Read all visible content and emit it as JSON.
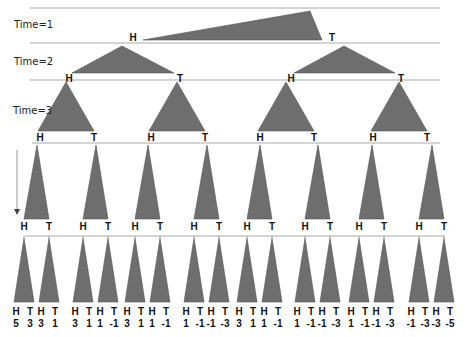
{
  "diagram": {
    "type": "binary coin-flip tree",
    "colors": {
      "triangle_fill": "#6e6e6e",
      "triangle_stroke": "#555555",
      "line": "#a9a9a9",
      "text": "#111111"
    },
    "time_labels": [
      "Time=1",
      "Time=2",
      "Time=3"
    ],
    "branch_labels": {
      "heads": "H",
      "tails": "T"
    },
    "levels": [
      {
        "level": 1,
        "nodes": 1
      },
      {
        "level": 2,
        "nodes": 2
      },
      {
        "level": 3,
        "nodes": 4
      },
      {
        "level": 4,
        "nodes": 8
      },
      {
        "level": 5,
        "nodes": 16
      }
    ],
    "leaf_values": [
      [
        "5",
        "3"
      ],
      [
        "3",
        "1"
      ],
      [
        "3",
        "1"
      ],
      [
        "1",
        "-1"
      ],
      [
        "3",
        "1"
      ],
      [
        "1",
        "-1"
      ],
      [
        "1",
        "-1"
      ],
      [
        "-1",
        "-3"
      ],
      [
        "3",
        "1"
      ],
      [
        "1",
        "-1"
      ],
      [
        "1",
        "-1"
      ],
      [
        "-1",
        "-3"
      ],
      [
        "1",
        "-1"
      ],
      [
        "-1",
        "-3"
      ],
      [
        "-1",
        "-3"
      ],
      [
        "-3",
        "-5"
      ]
    ]
  }
}
